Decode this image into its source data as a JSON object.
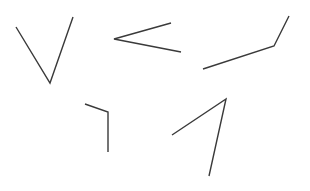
{
  "figure": {
    "width": 310,
    "height": 191,
    "background_color": "#ffffff",
    "stroke_color": "#3a3a3a",
    "stroke_width": 1.3,
    "shape_count": 5
  },
  "shapes": [
    {
      "name": "v-shape-top-left",
      "label": "V",
      "orientation": "opening upward",
      "stroke_color": "#3a3a3a",
      "stroke_width": 1.4,
      "vertex": [
        50,
        83
      ],
      "points": [
        [
          16,
          27
        ],
        [
          50,
          83
        ],
        [
          73,
          17
        ]
      ],
      "path": "M 16 27 L 50 83 L 73 17"
    },
    {
      "name": "less-than-shape-top-middle",
      "label": "<",
      "orientation": "opening rightward",
      "stroke_color": "#3a3a3a",
      "stroke_width": 1.4,
      "vertex": [
        114,
        39
      ],
      "points": [
        [
          171,
          23
        ],
        [
          114,
          39
        ],
        [
          181,
          52
        ]
      ],
      "path": "M 171 23 L 114 39 L 181 52"
    },
    {
      "name": "obtuse-check-shape-top-right",
      "label": "J",
      "orientation": "shallow rise then steep rise",
      "stroke_color": "#3a3a3a",
      "stroke_width": 1.4,
      "vertex": [
        274,
        46
      ],
      "points": [
        [
          203,
          69
        ],
        [
          274,
          46
        ],
        [
          289,
          16
        ]
      ],
      "path": "M 203 69 L 274 46 L 289 16"
    },
    {
      "name": "right-angle-shape-bottom-left",
      "label": "┐",
      "orientation": "corner opening down-left",
      "stroke_color": "#3a3a3a",
      "stroke_width": 1.4,
      "vertex": [
        108,
        112
      ],
      "points": [
        [
          85,
          104
        ],
        [
          108,
          112
        ],
        [
          108,
          152
        ]
      ],
      "path": "M 85 104 L 108 112 L 108 152"
    },
    {
      "name": "caret-shape-bottom-right",
      "label": "∧",
      "orientation": "narrow apex opening downward",
      "stroke_color": "#3a3a3a",
      "stroke_width": 1.4,
      "vertex": [
        226,
        99
      ],
      "points": [
        [
          172,
          135
        ],
        [
          226,
          99
        ],
        [
          209,
          176
        ]
      ],
      "path": "M 172 135 L 226 99 L 209 176"
    }
  ]
}
